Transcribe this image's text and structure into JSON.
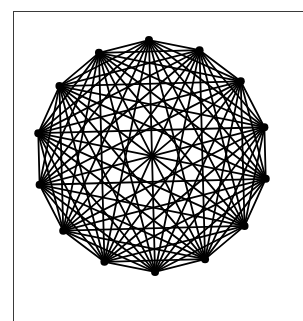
{
  "diagram": {
    "type": "complete-graph",
    "name": "K14",
    "vertex_count": 14,
    "layout": "regular-polygon",
    "center": [
      152,
      156
    ],
    "radius": 116,
    "start_angle_deg": -91.5,
    "stroke_color": "#000000",
    "stroke_width": 1.8,
    "vertex_radius": 4
  },
  "frame": {
    "border_color": "#3a3a3a"
  }
}
